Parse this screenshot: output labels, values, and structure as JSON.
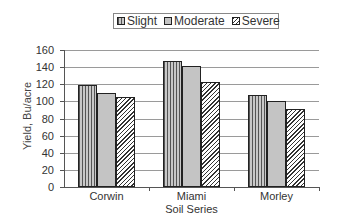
{
  "chart_data": {
    "type": "bar",
    "title": "",
    "xlabel": "Soil Series",
    "ylabel": "Yield, Bu/acre",
    "categories": [
      "Corwin",
      "Miami",
      "Morley"
    ],
    "series": [
      {
        "name": "Slight",
        "values": [
          119,
          147,
          108
        ],
        "pattern": "vertical-lines"
      },
      {
        "name": "Moderate",
        "values": [
          110,
          141,
          100
        ],
        "pattern": "solid-gray"
      },
      {
        "name": "Severe",
        "values": [
          105,
          123,
          91
        ],
        "pattern": "diagonal-hatch"
      }
    ],
    "ylim": [
      0,
      160
    ],
    "yticks": [
      0,
      20,
      40,
      60,
      80,
      100,
      120,
      140,
      160
    ],
    "grid": true,
    "legend_position": "top"
  },
  "legend": {
    "items": [
      {
        "label": "Slight"
      },
      {
        "label": "Moderate"
      },
      {
        "label": "Severe"
      }
    ]
  },
  "axes": {
    "ylabel": "Yield, Bu/acre",
    "xlabel": "Soil Series",
    "yticks": [
      "160",
      "140",
      "120",
      "100",
      "80",
      "60",
      "40",
      "20",
      "0"
    ],
    "categories": [
      "Corwin",
      "Miami",
      "Morley"
    ]
  }
}
